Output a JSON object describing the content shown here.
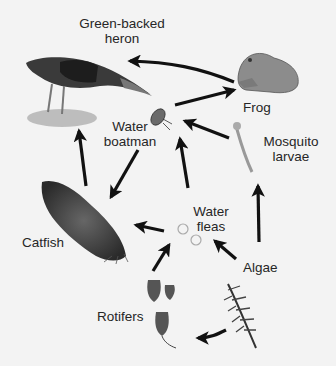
{
  "diagram": {
    "type": "food web",
    "organisms": [
      {
        "id": "heron",
        "label": "Green-backed heron"
      },
      {
        "id": "frog",
        "label": "Frog"
      },
      {
        "id": "boatman",
        "label": "Water boatman"
      },
      {
        "id": "mosquito",
        "label": "Mosquito larvae"
      },
      {
        "id": "catfish",
        "label": "Catfish"
      },
      {
        "id": "fleas",
        "label": "Water fleas"
      },
      {
        "id": "algae",
        "label": "Algae"
      },
      {
        "id": "rotifers",
        "label": "Rotifers"
      }
    ],
    "labels": {
      "heron_l1": "Green-backed",
      "heron_l2": "heron",
      "frog": "Frog",
      "boatman_l1": "Water",
      "boatman_l2": "boatman",
      "mosquito_l1": "Mosquito",
      "mosquito_l2": "larvae",
      "catfish": "Catfish",
      "fleas_l1": "Water",
      "fleas_l2": "fleas",
      "algae": "Algae",
      "rotifers": "Rotifers"
    },
    "arrows": [
      {
        "from": "frog",
        "to": "heron"
      },
      {
        "from": "boatman",
        "to": "frog"
      },
      {
        "from": "mosquito",
        "to": "boatman"
      },
      {
        "from": "catfish",
        "to": "heron"
      },
      {
        "from": "boatman",
        "to": "catfish"
      },
      {
        "from": "fleas",
        "to": "boatman"
      },
      {
        "from": "fleas",
        "to": "catfish"
      },
      {
        "from": "algae",
        "to": "mosquito"
      },
      {
        "from": "algae",
        "to": "fleas"
      },
      {
        "from": "rotifers",
        "to": "fleas"
      },
      {
        "from": "algae",
        "to": "rotifers"
      }
    ]
  }
}
